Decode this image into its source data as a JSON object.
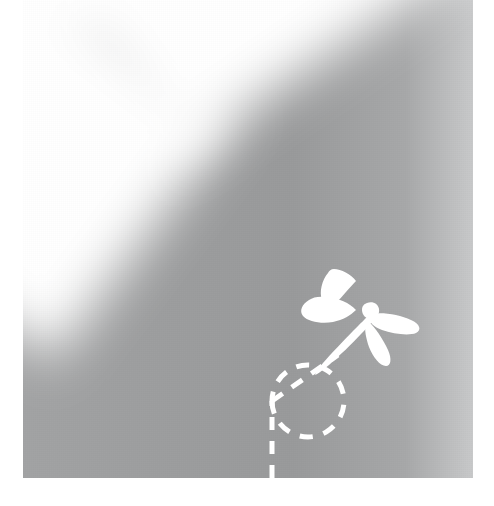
{
  "artwork": {
    "title": "Dragonfly with dashed flight trail",
    "medium": "flat vector illustration",
    "canvas": {
      "width": 494,
      "height": 506,
      "page_background": "#ffffff"
    },
    "plate": {
      "left": 23,
      "top": 0,
      "width": 450,
      "height": 478,
      "base_color": "#9a9b9c",
      "lightest_color": "#ffffff",
      "darkest_color": "#999a9b",
      "description": "soft grey gradient plate with a blurred white V-shaped light wedge"
    },
    "light_wedge": {
      "shape": "V",
      "apex_x": 165,
      "apex_y": 250,
      "color": "#ffffff",
      "blur_px": 26
    },
    "subject": {
      "name": "dragonfly",
      "color": "#ffffff",
      "position_x": 360,
      "position_y": 315,
      "wing_count": 4,
      "body_angle_deg": 40,
      "description": "white silhouette dragonfly, four wings, tapering abdomen pointing down-left"
    },
    "trail": {
      "name": "flight-trail",
      "color": "#ffffff",
      "stroke_width": 5,
      "dash_on": 13,
      "dash_off": 11,
      "segments": [
        {
          "kind": "line",
          "label": "vertical-entry",
          "from_x": 272,
          "from_y": 478,
          "to_x": 272,
          "to_y": 424
        },
        {
          "kind": "circle",
          "label": "loop",
          "center_x": 237,
          "center_y": 422,
          "radius": 36
        },
        {
          "kind": "line",
          "label": "diagonal-ascent",
          "from_x": 272,
          "from_y": 424,
          "to_x": 336,
          "to_y": 378
        }
      ]
    }
  }
}
